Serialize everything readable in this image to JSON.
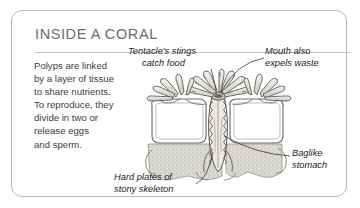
{
  "card": {
    "title": "INSIDE A CORAL",
    "body_lines": [
      "Polyps are linked",
      "by a layer of tissue",
      "to share nutrients.",
      "To reproduce, they",
      "divide in two or",
      "release eggs",
      "and sperm."
    ]
  },
  "callouts": {
    "tentacle": {
      "line1": "Tentacle's stings",
      "line2": "catch food"
    },
    "mouth": {
      "line1": "Mouth also",
      "line2": "expels waste"
    },
    "stomach": {
      "line1": "Baglike",
      "line2": "stomach"
    },
    "skeleton": {
      "line1": "Hard plates of",
      "line2": "stony skeleton"
    }
  },
  "colors": {
    "border": "#b9b9b9",
    "title": "#6d6d6d",
    "divider": "#c4c4c4",
    "body_text": "#3d3d3d",
    "callout_text": "#232323",
    "ink": "#4a4a4a",
    "skeleton_fill": "#d8d6d2",
    "tissue_fill": "#efeeec"
  },
  "illustration": {
    "subject": "coral-polyp-cross-section",
    "parts": [
      "tentacles",
      "mouth",
      "baglike-stomach",
      "stony-skeleton-plates",
      "connecting-tissue-layer"
    ]
  }
}
